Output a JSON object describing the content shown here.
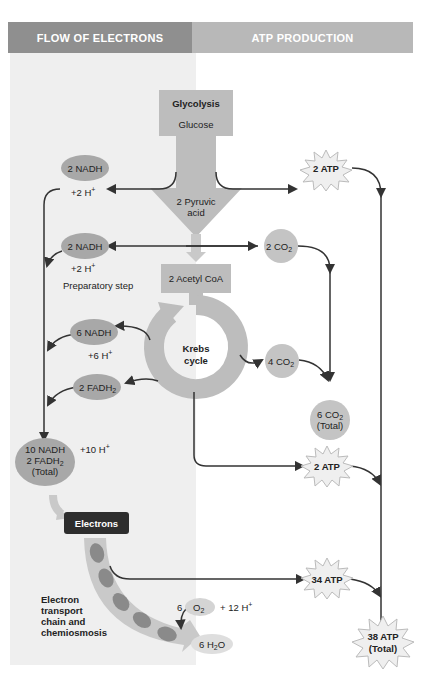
{
  "headers": {
    "left": "FLOW OF ELECTRONS",
    "right": "ATP PRODUCTION"
  },
  "glycolysis": {
    "title": "Glycolysis",
    "substrate": "Glucose",
    "product": "2 Pyruvic acid",
    "product_line1": "2 Pyruvic",
    "product_line2": "acid"
  },
  "glycolysis_outputs": {
    "nadh": "2 NADH",
    "h_plus": "+2 H",
    "atp": "2 ATP"
  },
  "preparatory_step": {
    "label": "Preparatory step",
    "nadh": "2 NADH",
    "h_plus": "+2 H",
    "co2_num": "2 CO",
    "product": "2 Acetyl CoA"
  },
  "krebs": {
    "line1": "Krebs",
    "line2": "cycle",
    "nadh": "6 NADH",
    "h_plus": "+6 H",
    "fadh2": "2 FADH",
    "co2": "4 CO",
    "atp": "2 ATP"
  },
  "totals": {
    "nadh_line1": "10 NADH",
    "nadh_line2": "2 FADH",
    "nadh_line3": "(Total)",
    "h_plus": "+10 H",
    "co2_line1": "6 CO",
    "co2_line2": "(Total)",
    "atp_line1": "38 ATP",
    "atp_line2": "(Total)"
  },
  "etc": {
    "box": "Electrons",
    "label_line1": "Electron",
    "label_line2": "transport",
    "label_line3": "chain and",
    "label_line4": "chemiosmosis",
    "o2_coef": "6",
    "o2": "O",
    "h_plus": "+ 12 H",
    "water": "6 H",
    "water_tail": "O",
    "atp": "34 ATP"
  },
  "colors": {
    "header_left": "#8f8f8f",
    "header_right": "#b8b8b8",
    "panel_bg": "#efefef",
    "shape_fill": "#bdbdbd",
    "oval_fill": "#a8a8a8",
    "electrons_box": "#2e2e2e",
    "line": "#333333"
  }
}
